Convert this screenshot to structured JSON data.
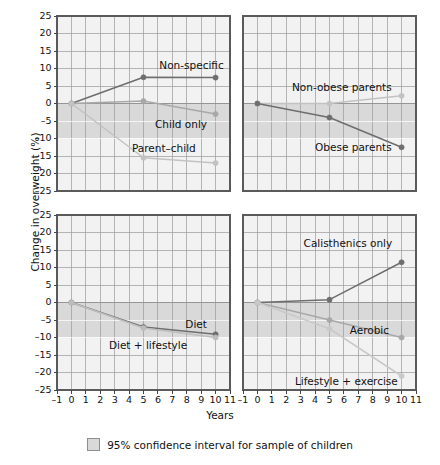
{
  "chart_data": {
    "type": "line",
    "title": "",
    "xlabel": "Years",
    "ylabel": "Change in overweight (%)",
    "xlim": [
      -1,
      11
    ],
    "ylim": [
      -25,
      25
    ],
    "x_ticks": [
      "-1",
      "0",
      "1",
      "2",
      "3",
      "4",
      "5",
      "6",
      "7",
      "8",
      "9",
      "10",
      "11"
    ],
    "y_ticks": [
      "25",
      "20",
      "15",
      "10",
      "5",
      "0",
      "-5",
      "-10",
      "-15",
      "-20",
      "-25"
    ],
    "grid": true,
    "legend_position": "bottom",
    "legend": [
      {
        "label": "95% confidence interval for sample of children",
        "swatch": "#d9d9d9"
      }
    ],
    "shared_x": [
      0,
      5,
      10
    ],
    "panels": [
      {
        "id": "panel-top-left",
        "ci_band": [
          0,
          -10
        ],
        "series": [
          {
            "name": "Non-specific",
            "values": [
              0,
              7.5,
              7.4
            ],
            "color": "#6e6e6e",
            "label_x": 6.1,
            "label_y": 10.6,
            "label_anchor": "start"
          },
          {
            "name": "Child only",
            "values": [
              0,
              0.7,
              -3.0
            ],
            "color": "#a8a8a8",
            "label_x": 5.8,
            "label_y": -6.2,
            "label_anchor": "start"
          },
          {
            "name": "Parent–child",
            "values": [
              0,
              -15.5,
              -17.0
            ],
            "color": "#c2c2c2",
            "label_x": 4.2,
            "label_y": -13.0,
            "label_anchor": "start"
          }
        ]
      },
      {
        "id": "panel-top-right",
        "ci_band": [
          0,
          -10
        ],
        "series": [
          {
            "name": "Non-obese parents",
            "values": [
              0,
              0.0,
              2.2
            ],
            "color": "#c2c2c2",
            "label_x": 2.4,
            "label_y": 4.3,
            "label_anchor": "start"
          },
          {
            "name": "Obese parents",
            "values": [
              0,
              -4.0,
              -12.5
            ],
            "color": "#6e6e6e",
            "label_x": 4.0,
            "label_y": -12.6,
            "label_anchor": "start"
          }
        ]
      },
      {
        "id": "panel-bottom-left",
        "ci_band": [
          0,
          -10
        ],
        "series": [
          {
            "name": "Diet",
            "values": [
              0,
              -7.0,
              -9.1
            ],
            "color": "#6e6e6e",
            "label_x": 7.9,
            "label_y": -6.4,
            "label_anchor": "start"
          },
          {
            "name": "Diet + lifestyle",
            "values": [
              0,
              -7.3,
              -10.0
            ],
            "color": "#bdbdbd",
            "label_x": 2.6,
            "label_y": -12.3,
            "label_anchor": "start"
          }
        ]
      },
      {
        "id": "panel-bottom-right",
        "ci_band": [
          0,
          -10
        ],
        "series": [
          {
            "name": "Calisthenics only",
            "values": [
              0,
              0.8,
              11.5
            ],
            "color": "#6e6e6e",
            "label_x": 3.2,
            "label_y": 16.6,
            "label_anchor": "start"
          },
          {
            "name": "Aerobic",
            "values": [
              0,
              -5.0,
              -10.0
            ],
            "color": "#a8a8a8",
            "label_x": 6.4,
            "label_y": -8.2,
            "label_anchor": "start"
          },
          {
            "name": "Lifestyle + exercise",
            "values": [
              0,
              -7.5,
              -21.0
            ],
            "color": "#c9c9c9",
            "label_x": 2.6,
            "label_y": -22.6,
            "label_anchor": "start"
          }
        ]
      }
    ]
  },
  "axis": {
    "y_title": "Change in overweight (%)",
    "x_title": "Years"
  },
  "legend_caption": "95% confidence interval for sample of children",
  "colors": {
    "panel_bg": "#f2f2f2",
    "grid_minor": "#cfcfcf",
    "grid_major": "#8f8f8f",
    "band": "#d9d9d9",
    "frame": "#5a5a5a"
  }
}
